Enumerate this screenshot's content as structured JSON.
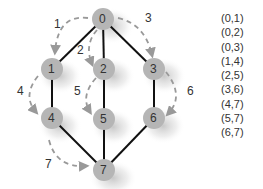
{
  "diagram": {
    "nodes": [
      {
        "id": "0",
        "x": 103,
        "y": 19
      },
      {
        "id": "1",
        "x": 52,
        "y": 69
      },
      {
        "id": "2",
        "x": 104,
        "y": 69
      },
      {
        "id": "3",
        "x": 154,
        "y": 69
      },
      {
        "id": "4",
        "x": 52,
        "y": 118
      },
      {
        "id": "5",
        "x": 104,
        "y": 119
      },
      {
        "id": "6",
        "x": 154,
        "y": 118
      },
      {
        "id": "7",
        "x": 104,
        "y": 170
      }
    ],
    "edges": [
      [
        0,
        1
      ],
      [
        0,
        2
      ],
      [
        0,
        3
      ],
      [
        1,
        4
      ],
      [
        2,
        5
      ],
      [
        3,
        6
      ],
      [
        4,
        7
      ],
      [
        5,
        7
      ],
      [
        6,
        7
      ]
    ],
    "traversal_arrows": [
      {
        "label": "1",
        "from": 0,
        "to": 1
      },
      {
        "label": "2",
        "from": 0,
        "to": 2
      },
      {
        "label": "3",
        "from": 0,
        "to": 3
      },
      {
        "label": "4",
        "from": 1,
        "to": 4
      },
      {
        "label": "5",
        "from": 2,
        "to": 5
      },
      {
        "label": "6",
        "from": 3,
        "to": 6
      },
      {
        "label": "7",
        "from": 4,
        "to": 7
      }
    ]
  },
  "edge_list": [
    "(0,1)",
    "(0,2)",
    "(0,3)",
    "(1,4)",
    "(2,5)",
    "(3,6)",
    "(4,7)",
    "(5,7)",
    "(6,7)"
  ],
  "colors": {
    "edge": "#111111",
    "node_fill": "#b8b8b8",
    "arrow": "#999999",
    "text": "#333333"
  }
}
